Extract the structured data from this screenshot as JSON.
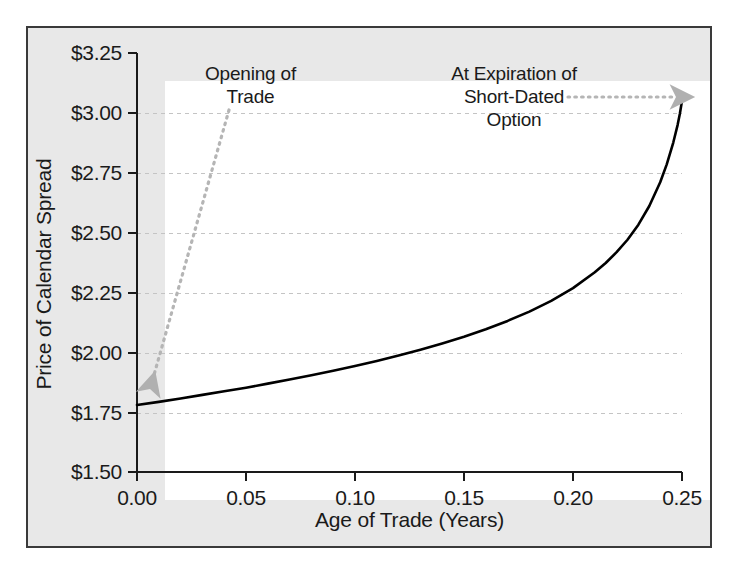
{
  "chart_data": {
    "type": "line",
    "title": "",
    "subtitle": "",
    "xlabel": "Age of Trade (Years)",
    "ylabel": "Price of Calendar Spread",
    "xlim": [
      0.0,
      0.25
    ],
    "ylim": [
      1.5,
      3.25
    ],
    "xticks": [
      "0.00",
      "0.05",
      "0.10",
      "0.15",
      "0.20",
      "0.25"
    ],
    "xtick_values": [
      0.0,
      0.05,
      0.1,
      0.15,
      0.2,
      0.25
    ],
    "yticks": [
      "$1.50",
      "$1.75",
      "$2.00",
      "$2.25",
      "$2.50",
      "$2.75",
      "$3.00",
      "$3.25"
    ],
    "ytick_values": [
      1.5,
      1.75,
      2.0,
      2.25,
      2.5,
      2.75,
      3.0,
      3.25
    ],
    "grid": true,
    "grid_style": "dashed-horizontal",
    "legend": "none",
    "line_color": "#000000",
    "line_width": 2.6,
    "series": [
      {
        "name": "Calendar spread price",
        "x": [
          0.0,
          0.01,
          0.02,
          0.03,
          0.04,
          0.05,
          0.06,
          0.07,
          0.08,
          0.09,
          0.1,
          0.11,
          0.12,
          0.13,
          0.14,
          0.15,
          0.16,
          0.17,
          0.18,
          0.19,
          0.2,
          0.21,
          0.215,
          0.22,
          0.225,
          0.23,
          0.235,
          0.24,
          0.243,
          0.246,
          0.248,
          0.249,
          0.25
        ],
        "y": [
          1.78,
          1.793,
          1.807,
          1.822,
          1.837,
          1.852,
          1.869,
          1.886,
          1.904,
          1.923,
          1.943,
          1.964,
          1.987,
          2.011,
          2.037,
          2.065,
          2.096,
          2.131,
          2.17,
          2.215,
          2.268,
          2.334,
          2.373,
          2.418,
          2.47,
          2.533,
          2.611,
          2.71,
          2.785,
          2.876,
          2.95,
          2.995,
          3.05
        ]
      }
    ],
    "annotations": [
      {
        "name": "opening-of-trade",
        "lines": [
          "Opening of",
          "Trade"
        ],
        "arrow": "dotted-gray",
        "points_to_x": 0.0,
        "points_to_y": 1.78
      },
      {
        "name": "at-expiration-of-short-dated-option",
        "lines": [
          "At Expiration of",
          "Short-Dated",
          "Option"
        ],
        "arrow": "dotted-gray",
        "points_to_x": 0.25,
        "points_to_y": 3.05
      }
    ],
    "colors": {
      "panel_background": "#e8e8e8",
      "plot_background": "#ffffff",
      "frame": "#3a3a3a",
      "axis": "#1a1a1a",
      "gridline": "#c8c8c8",
      "curve": "#000000",
      "annotation_arrow": "#b5b5b5",
      "text": "#1a1a1a"
    }
  },
  "axes": {
    "y_title": "Price of Calendar Spread",
    "x_title": "Age of Trade (Years)",
    "y_labels": [
      "$3.25",
      "$3.00",
      "$2.75",
      "$2.50",
      "$2.25",
      "$2.00",
      "$1.75",
      "$1.50"
    ],
    "x_labels": [
      "0.00",
      "0.05",
      "0.10",
      "0.15",
      "0.20",
      "0.25"
    ]
  },
  "annotations": {
    "opening": {
      "line1": "Opening of",
      "line2": "Trade"
    },
    "expiration": {
      "line1": "At Expiration of",
      "line2": "Short-Dated",
      "line3": "Option"
    }
  }
}
